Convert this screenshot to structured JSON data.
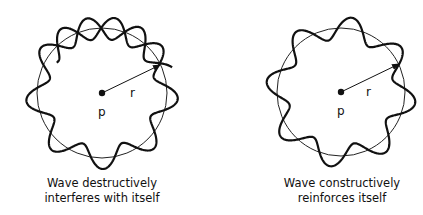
{
  "panels": [
    {
      "id": "destructive",
      "center_label": "p",
      "radius_label": "r",
      "caption_line1": "Wave destructively",
      "caption_line2": "interferes with itself",
      "wave_type": "non-closing (phase mismatch)",
      "lobes": 8.5
    },
    {
      "id": "constructive",
      "center_label": "p",
      "radius_label": "r",
      "caption_line1": "Wave constructively",
      "caption_line2": "reinforces itself",
      "wave_type": "closed standing wave",
      "lobes": 8
    }
  ],
  "colors": {
    "ink": "#111111",
    "background": "#ffffff"
  }
}
